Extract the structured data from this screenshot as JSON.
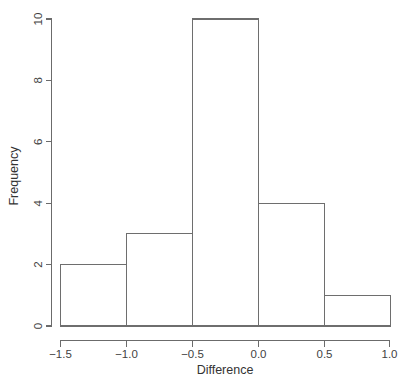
{
  "chart_data": {
    "type": "bar",
    "subtype": "histogram",
    "title": "",
    "xlabel": "Difference",
    "ylabel": "Frequency",
    "xlim": [
      -1.5,
      1.0
    ],
    "ylim": [
      0,
      10
    ],
    "grid": false,
    "legend": false,
    "bin_width": 0.5,
    "categories": [
      "-1.5 to -1.0",
      "-1.0 to -0.5",
      "-0.5 to 0.0",
      "0.0 to 0.5",
      "0.5 to 1.0"
    ],
    "bin_edges": [
      -1.5,
      -1.0,
      -0.5,
      0.0,
      0.5,
      1.0
    ],
    "values": [
      2,
      3,
      10,
      4,
      1
    ],
    "bars": [
      {
        "bin_start": -1.5,
        "bin_end": -1.0,
        "frequency": 2
      },
      {
        "bin_start": -1.0,
        "bin_end": -0.5,
        "frequency": 3
      },
      {
        "bin_start": -0.5,
        "bin_end": 0.0,
        "frequency": 10
      },
      {
        "bin_start": 0.0,
        "bin_end": 0.5,
        "frequency": 4
      },
      {
        "bin_start": 0.5,
        "bin_end": 1.0,
        "frequency": 1
      }
    ],
    "total_count": 20,
    "x_ticks": [
      -1.5,
      -1.0,
      -0.5,
      0.0,
      0.5,
      1.0
    ],
    "x_tick_labels": [
      "−1.5",
      "−1.0",
      "−0.5",
      "0.0",
      "0.5",
      "1.0"
    ],
    "y_ticks": [
      0,
      2,
      4,
      6,
      8,
      10
    ],
    "y_tick_labels": [
      "0",
      "2",
      "4",
      "6",
      "8",
      "10"
    ],
    "colors": {
      "background": "#ffffff",
      "bar_fill": "#ffffff",
      "bar_stroke": "#6e6e6e",
      "axis": "#6b6b6b",
      "text": "#3f3f3f"
    }
  },
  "axes": {
    "x_title": "Difference",
    "y_title": "Frequency"
  },
  "x_tick_labels": {
    "t0": "−1.5",
    "t1": "−1.0",
    "t2": "−0.5",
    "t3": "0.0",
    "t4": "0.5",
    "t5": "1.0"
  },
  "y_tick_labels": {
    "t0": "0",
    "t1": "2",
    "t2": "4",
    "t3": "6",
    "t4": "8",
    "t5": "10"
  }
}
